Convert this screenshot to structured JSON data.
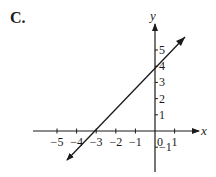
{
  "option_label": "C.",
  "chart_data": {
    "type": "line",
    "title": "",
    "xlabel": "x",
    "ylabel": "y",
    "x_ticks": [
      -5,
      -4,
      -3,
      -2,
      -1,
      0,
      1
    ],
    "y_ticks": [
      -1,
      1,
      2,
      3,
      4,
      5
    ],
    "xlim": [
      -5.8,
      1.8
    ],
    "ylim": [
      -2.4,
      5.6
    ],
    "grid": false,
    "series": [
      {
        "name": "line",
        "equation": "y = (4/3)x + 4",
        "x_intercept": -3,
        "y_intercept": 4,
        "x": [
          -4.5,
          1.5
        ],
        "y": [
          -2,
          6
        ],
        "arrows": "both"
      }
    ]
  }
}
